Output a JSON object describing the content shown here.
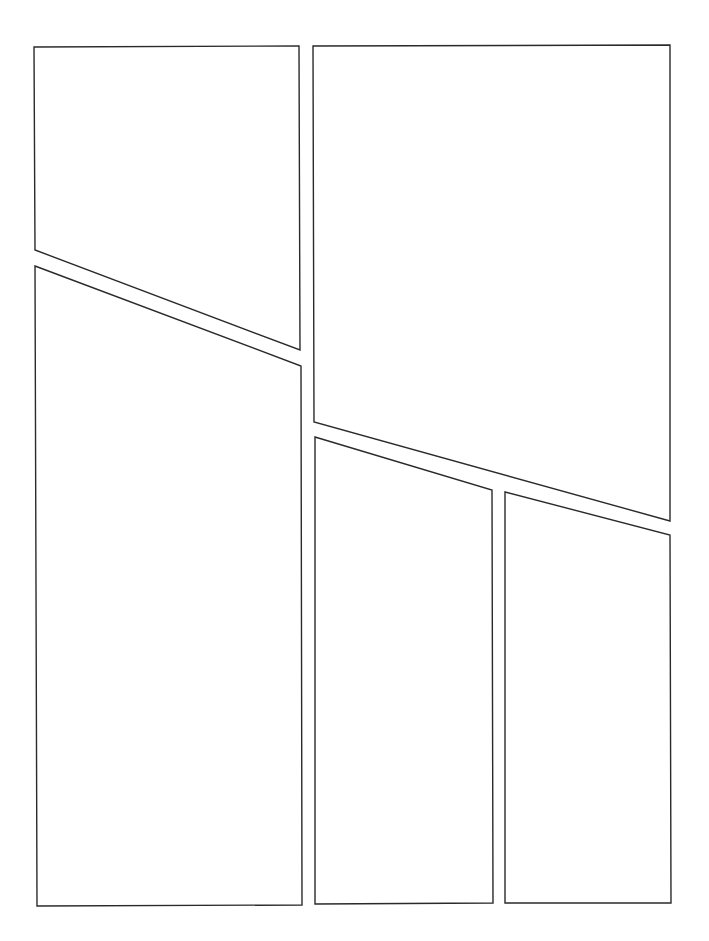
{
  "page": {
    "width": 709,
    "height": 941,
    "background": "#ffffff",
    "border_color": "#2a2a2a",
    "panel_count": 5
  },
  "panels": [
    {
      "id": "panel-1",
      "position": "top-left",
      "points": "34,47 299,46 300,350 35,250"
    },
    {
      "id": "panel-2",
      "position": "top-right",
      "points": "313,46 670,45 670,521 314,422"
    },
    {
      "id": "panel-3",
      "position": "bottom-left",
      "points": "35,266 301,366 302,905 37,906"
    },
    {
      "id": "panel-4",
      "position": "bottom-middle",
      "points": "315,437 492,490 493,903 315,904"
    },
    {
      "id": "panel-5",
      "position": "bottom-right",
      "points": "505,492 670,535 671,903 505,903"
    }
  ]
}
